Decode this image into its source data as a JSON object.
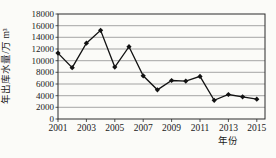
{
  "figure": {
    "background": "#fbfbf8",
    "line_color": "#121212",
    "border_color": "#2a2a2a",
    "grid_color": "#808080",
    "text_color": "#1a1a1a"
  },
  "chart_data": {
    "type": "line",
    "title": "",
    "xlabel": "年份",
    "ylabel": "年出库水量/万 m³",
    "x": [
      2001,
      2002,
      2003,
      2004,
      2005,
      2006,
      2007,
      2008,
      2009,
      2010,
      2011,
      2012,
      2013,
      2014,
      2015
    ],
    "values": [
      11300,
      8800,
      13000,
      15200,
      8900,
      12400,
      7400,
      5000,
      6600,
      6500,
      7300,
      3200,
      4200,
      3800,
      3400
    ],
    "ylim": [
      0,
      18000
    ],
    "ytick_step": 2000,
    "ytick_labels": [
      "0",
      "2000",
      "4000",
      "6000",
      "8000",
      "10000",
      "12000",
      "14000",
      "16000",
      "18000"
    ],
    "xtick_labels": [
      "2001",
      "2003",
      "2005",
      "2007",
      "2009",
      "2011",
      "2013",
      "2015"
    ],
    "grid": "horizontal",
    "legend": "none",
    "marker": "diamond"
  }
}
